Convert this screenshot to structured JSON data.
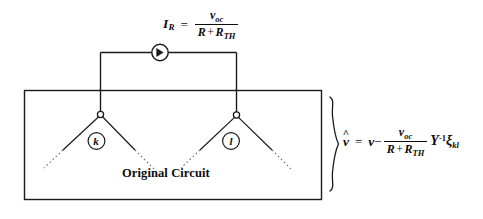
{
  "figure": {
    "type": "circuit-diagram",
    "background_color": "#ffffff",
    "stroke_color": "#1a1a1a",
    "box_label": "Original Circuit",
    "node_labels": {
      "left": "k",
      "right": "l"
    },
    "source_symbol": "current-source-arrow-in-circle"
  },
  "equations": {
    "top": {
      "lhs_symbol": "I",
      "lhs_subscript": "R",
      "equals": "=",
      "numerator": "v",
      "numerator_subscript": "oc",
      "denominator_first": "R",
      "denominator_plus": "+",
      "denominator_second": "R",
      "denominator_second_subscript": "TH",
      "plain_text": "I_R = v_oc / (R + R_TH)"
    },
    "right": {
      "lhs_symbol": "v",
      "lhs_hat": "^",
      "equals": "=",
      "first_term": "v",
      "minus": "−",
      "numerator": "v",
      "numerator_subscript": "oc",
      "denominator_first": "R",
      "denominator_plus": "+",
      "denominator_second": "R",
      "denominator_second_subscript": "TH",
      "matrix_symbol": "Y",
      "matrix_exponent": "-1",
      "vector_symbol": "ξ",
      "vector_subscript": "kl",
      "plain_text": "v̂ = v − v_oc/(R + R_TH) Y^-1 ξ_kl"
    }
  }
}
